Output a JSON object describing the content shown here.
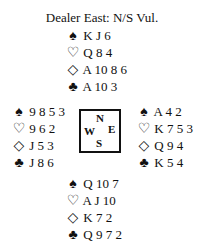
{
  "title": "Dealer East: N/S Vul.",
  "suits": {
    "spades": "♠",
    "hearts": "♡",
    "diamonds": "◇",
    "clubs": "♣"
  },
  "hands": {
    "north": {
      "spades": "K J 6",
      "hearts": "Q 8 4",
      "diamonds": "A 10 8 6",
      "clubs": "A 10 3"
    },
    "west": {
      "spades": "9 8 5 3",
      "hearts": "9 6 2",
      "diamonds": "J 5 3",
      "clubs": "J 8 6"
    },
    "east": {
      "spades": "A 4 2",
      "hearts": "K 7 5 3",
      "diamonds": "Q 9 4",
      "clubs": "K 5 4"
    },
    "south": {
      "spades": "Q 10 7",
      "hearts": "A J 10",
      "diamonds": "K 7 2",
      "clubs": "Q 9 7 2"
    }
  },
  "compass": {
    "n": "N",
    "w": "W",
    "e": "E",
    "s": "S"
  }
}
